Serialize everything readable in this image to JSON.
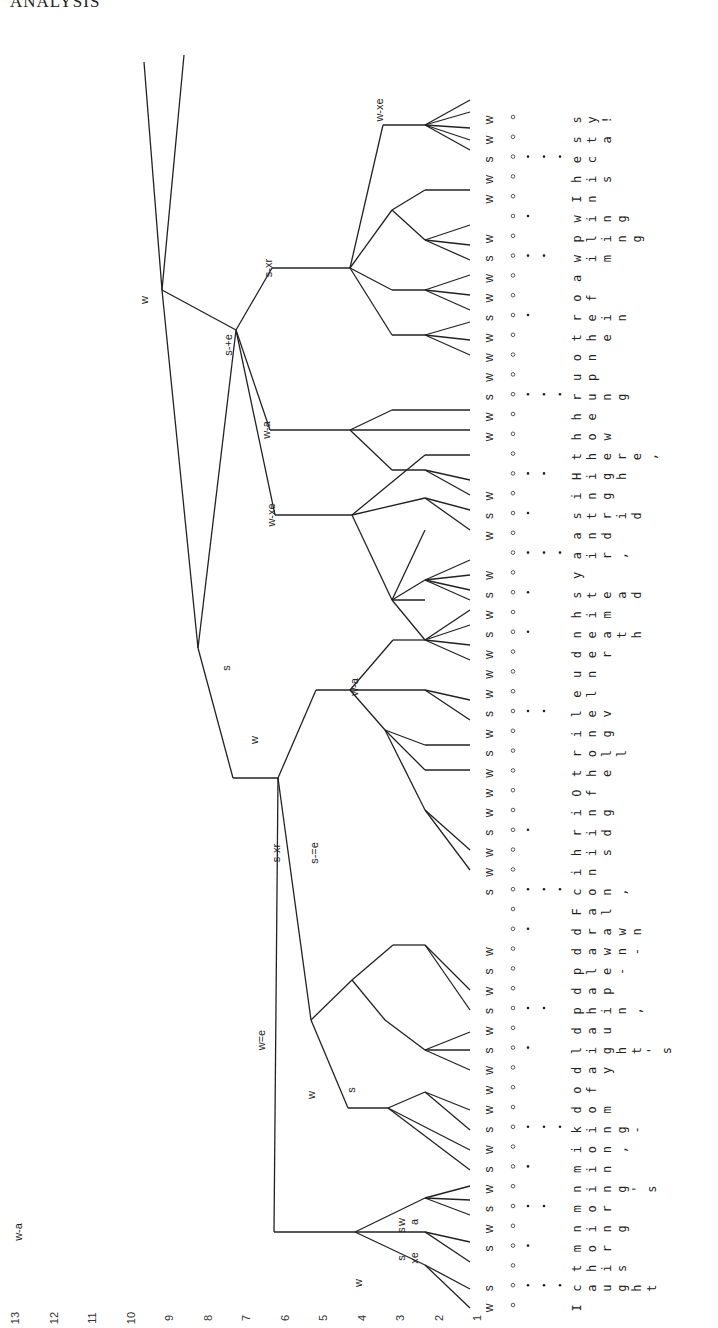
{
  "page": {
    "header": "ANALYSIS"
  },
  "figure": {
    "orientation": "rotated 90 degrees counterclockwise",
    "level_axis": {
      "labels": [
        "13",
        "12",
        "11",
        "10",
        "9",
        "8",
        "7",
        "6",
        "5",
        "4",
        "3",
        "2",
        "1"
      ]
    },
    "syllables": [
      {
        "t": "I",
        "sw": "w",
        "grid": 0
      },
      {
        "t": "caught",
        "sw": "s",
        "grid": 3
      },
      {
        "t": "this",
        "sw": "",
        "grid": 0
      },
      {
        "t": "mor",
        "sw": "s",
        "grid": 1
      },
      {
        "t": "ning",
        "sw": "w",
        "grid": 0
      },
      {
        "t": "mor",
        "sw": "s",
        "grid": 2
      },
      {
        "t": "ning's",
        "sw": "w",
        "grid": 0
      },
      {
        "t": "min",
        "sw": "s",
        "grid": 1
      },
      {
        "t": "ion,",
        "sw": "w",
        "grid": 0
      },
      {
        "t": "king-",
        "sw": "s",
        "grid": 3
      },
      {
        "t": "dom",
        "sw": "w",
        "grid": 0
      },
      {
        "t": "of",
        "sw": "w",
        "grid": 0
      },
      {
        "t": "day",
        "sw": "w",
        "grid": 0
      },
      {
        "t": "light's",
        "sw": "s",
        "grid": 1
      },
      {
        "t": "dau",
        "sw": "w",
        "grid": 0
      },
      {
        "t": "phin,",
        "sw": "s",
        "grid": 2
      },
      {
        "t": "dap",
        "sw": "w",
        "grid": 0
      },
      {
        "t": "ple-",
        "sw": "s",
        "grid": 0
      },
      {
        "t": "dawn-",
        "sw": "w",
        "grid": 0
      },
      {
        "t": "drawn",
        "sw": "",
        "grid": 1
      },
      {
        "t": "Fal",
        "sw": "",
        "grid": 0
      },
      {
        "t": "con,",
        "sw": "s",
        "grid": 3
      },
      {
        "t": "in",
        "sw": "w",
        "grid": 0
      },
      {
        "t": "his",
        "sw": "w",
        "grid": 0
      },
      {
        "t": "rid",
        "sw": "s",
        "grid": 1
      },
      {
        "t": "ing",
        "sw": "w",
        "grid": 0
      },
      {
        "t": "Of",
        "sw": "w",
        "grid": 0
      },
      {
        "t": "the",
        "sw": "w",
        "grid": 0
      },
      {
        "t": "roll",
        "sw": "s",
        "grid": 0
      },
      {
        "t": "ing",
        "sw": "w",
        "grid": 0
      },
      {
        "t": "lev",
        "sw": "s",
        "grid": 2
      },
      {
        "t": "el",
        "sw": "w",
        "grid": 0
      },
      {
        "t": "un",
        "sw": "w",
        "grid": 0
      },
      {
        "t": "der",
        "sw": "w",
        "grid": 0
      },
      {
        "t": "neath",
        "sw": "s",
        "grid": 1
      },
      {
        "t": "him",
        "sw": "w",
        "grid": 0
      },
      {
        "t": "stead",
        "sw": "s",
        "grid": 1
      },
      {
        "t": "y",
        "sw": "w",
        "grid": 0
      },
      {
        "t": "air,",
        "sw": "",
        "grid": 3
      },
      {
        "t": "and",
        "sw": "w",
        "grid": 0
      },
      {
        "t": "strid",
        "sw": "s",
        "grid": 1
      },
      {
        "t": "ing",
        "sw": "w",
        "grid": 0
      },
      {
        "t": "High",
        "sw": "",
        "grid": 2
      },
      {
        "t": "there,",
        "sw": "",
        "grid": 0
      },
      {
        "t": "how",
        "sw": "w",
        "grid": 0
      },
      {
        "t": "he",
        "sw": "w",
        "grid": 0
      },
      {
        "t": "rung",
        "sw": "s",
        "grid": 3
      },
      {
        "t": "up",
        "sw": "w",
        "grid": 0
      },
      {
        "t": "on",
        "sw": "w",
        "grid": 0
      },
      {
        "t": "the",
        "sw": "w",
        "grid": 0
      },
      {
        "t": "rein",
        "sw": "s",
        "grid": 1
      },
      {
        "t": "of",
        "sw": "w",
        "grid": 0
      },
      {
        "t": "a",
        "sw": "w",
        "grid": 0
      },
      {
        "t": "wim",
        "sw": "s",
        "grid": 2
      },
      {
        "t": "pling",
        "sw": "w",
        "grid": 0
      },
      {
        "t": "wing",
        "sw": "",
        "grid": 1
      },
      {
        "t": "In",
        "sw": "w",
        "grid": 0
      },
      {
        "t": "his",
        "sw": "w",
        "grid": 0
      },
      {
        "t": "ec",
        "sw": "s",
        "grid": 3
      },
      {
        "t": "sta",
        "sw": "w",
        "grid": 0
      },
      {
        "t": "sy!",
        "sw": "w",
        "grid": 0
      }
    ],
    "node_labels": [
      {
        "t": "w-a",
        "x": 22,
        "y": 1232
      },
      {
        "t": "w",
        "x": 362,
        "y": 1283
      },
      {
        "t": "s",
        "x": 405,
        "y": 1258
      },
      {
        "t": "xe",
        "x": 418,
        "y": 1258
      },
      {
        "t": "w",
        "x": 405,
        "y": 1222
      },
      {
        "t": "a",
        "x": 418,
        "y": 1222
      },
      {
        "t": "s",
        "x": 405,
        "y": 1230
      },
      {
        "t": "s",
        "x": 355,
        "y": 1090
      },
      {
        "t": "w",
        "x": 315,
        "y": 1095
      },
      {
        "t": "w=e",
        "x": 265,
        "y": 1040
      },
      {
        "t": "s-xr",
        "x": 280,
        "y": 853
      },
      {
        "t": "s-=e",
        "x": 318,
        "y": 853
      },
      {
        "t": "w",
        "x": 258,
        "y": 740
      },
      {
        "t": "s",
        "x": 230,
        "y": 668
      },
      {
        "t": "w-a",
        "x": 358,
        "y": 687
      },
      {
        "t": "w-xe",
        "x": 275,
        "y": 515
      },
      {
        "t": "w-a",
        "x": 270,
        "y": 430
      },
      {
        "t": "s-+e",
        "x": 232,
        "y": 345
      },
      {
        "t": "s-xr",
        "x": 272,
        "y": 268
      },
      {
        "t": "w",
        "x": 148,
        "y": 300
      },
      {
        "t": "w-xe",
        "x": 383,
        "y": 110
      }
    ]
  }
}
